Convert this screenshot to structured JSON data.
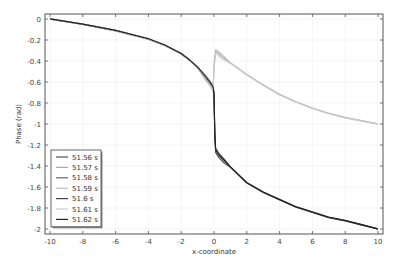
{
  "chart_data": {
    "type": "line",
    "title": "",
    "xlabel": "x-coordinate",
    "ylabel": "Phase (rad)",
    "xlim": [
      -10,
      10
    ],
    "ylim": [
      -2.05,
      0.05
    ],
    "xticks": [
      -10,
      -8,
      -6,
      -4,
      -2,
      0,
      2,
      4,
      6,
      8,
      10
    ],
    "xtick_labels": [
      "-10",
      "-8",
      "-6",
      "-4",
      "-2",
      "0",
      "2",
      "4",
      "6",
      "8",
      "10"
    ],
    "yticks": [
      0,
      -0.2,
      -0.4,
      -0.6,
      -0.8,
      -1,
      -1.2,
      -1.4,
      -1.6,
      -1.8,
      -2
    ],
    "ytick_labels": [
      "0",
      "-0.2",
      "-0.4",
      "-0.6",
      "-0.8",
      "-1",
      "-1.2",
      "-1.4",
      "-1.6",
      "-1.8",
      "-2"
    ],
    "grid": true,
    "legend_position": "bottom-left",
    "series": [
      {
        "name": "51.56 s",
        "color": "#555555",
        "branch": "lower",
        "offset": 0.0
      },
      {
        "name": "51.57 s",
        "color": "#aaaaaa",
        "branch": "upper",
        "offset": 0.0
      },
      {
        "name": "51.58 s",
        "color": "#666666",
        "branch": "lower",
        "offset": 0.01
      },
      {
        "name": "51.59 s",
        "color": "#bbbbbb",
        "branch": "upper",
        "offset": 0.01
      },
      {
        "name": "51.6 s",
        "color": "#444444",
        "branch": "lower",
        "offset": -0.01
      },
      {
        "name": "51.61 s",
        "color": "#cccccc",
        "branch": "upper",
        "offset": -0.01
      },
      {
        "name": "51.62 s",
        "color": "#222222",
        "branch": "lower",
        "offset": 0.005
      }
    ],
    "shared_left": {
      "x": [
        -10,
        -8,
        -6,
        -4,
        -3,
        -2,
        -1.5,
        -1,
        -0.5,
        -0.2,
        -0.05
      ],
      "y": [
        0,
        -0.05,
        -0.11,
        -0.19,
        -0.25,
        -0.33,
        -0.39,
        -0.46,
        -0.56,
        -0.62,
        -0.66
      ]
    },
    "upper_branch": {
      "x": [
        -0.05,
        0.0,
        0.1,
        0.5,
        1,
        2,
        3,
        4,
        5,
        6,
        7,
        8,
        9,
        10
      ],
      "y": [
        -0.66,
        -0.45,
        -0.31,
        -0.36,
        -0.42,
        -0.53,
        -0.63,
        -0.72,
        -0.79,
        -0.85,
        -0.9,
        -0.94,
        -0.97,
        -1.0
      ]
    },
    "lower_branch": {
      "x": [
        -0.05,
        0.0,
        0.05,
        0.1,
        0.3,
        0.6,
        1,
        2,
        3,
        4,
        5,
        6,
        7,
        8,
        9,
        10
      ],
      "y": [
        -0.66,
        -0.72,
        -1.1,
        -1.25,
        -1.3,
        -1.35,
        -1.41,
        -1.56,
        -1.65,
        -1.72,
        -1.79,
        -1.84,
        -1.89,
        -1.92,
        -1.96,
        -2.0
      ]
    }
  }
}
